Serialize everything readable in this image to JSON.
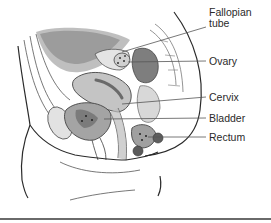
{
  "diagram": {
    "type": "anatomical-illustration",
    "style": "grayscale",
    "labels": [
      {
        "id": "fallopian-tube",
        "line1": "Fallopian",
        "line2": "tube"
      },
      {
        "id": "ovary",
        "text": "Ovary"
      },
      {
        "id": "cervix",
        "text": "Cervix"
      },
      {
        "id": "bladder",
        "text": "Bladder"
      },
      {
        "id": "rectum",
        "text": "Rectum"
      }
    ]
  },
  "colors": {
    "outline": "#2a2a2a",
    "leader_line": "#555555",
    "dark_tissue": "#8a8a8a",
    "mid_tissue": "#b5b5b5",
    "light_tissue": "#dcdcdc",
    "background": "#ffffff",
    "divider": "#6a6a6a"
  }
}
